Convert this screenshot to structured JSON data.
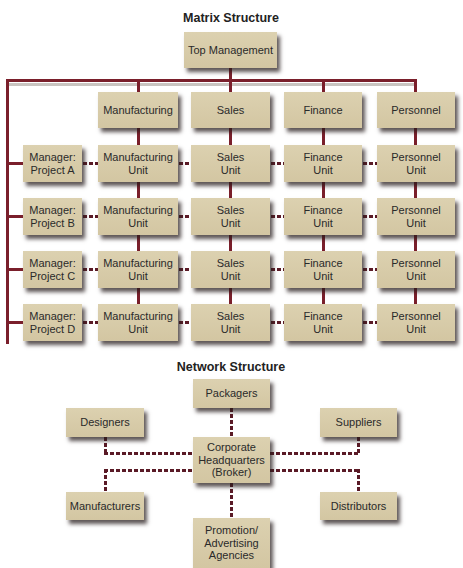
{
  "matrix": {
    "title": "Matrix Structure",
    "top": "Top Management",
    "departments": [
      "Manufacturing",
      "Sales",
      "Finance",
      "Personnel"
    ],
    "projects": [
      {
        "manager": "Manager:\nProject A",
        "units": [
          "Manufacturing\nUnit",
          "Sales\nUnit",
          "Finance\nUnit",
          "Personnel\nUnit"
        ]
      },
      {
        "manager": "Manager:\nProject B",
        "units": [
          "Manufacturing\nUnit",
          "Sales\nUnit",
          "Finance\nUnit",
          "Personnel\nUnit"
        ]
      },
      {
        "manager": "Manager:\nProject C",
        "units": [
          "Manufacturing\nUnit",
          "Sales\nUnit",
          "Finance\nUnit",
          "Personnel\nUnit"
        ]
      },
      {
        "manager": "Manager:\nProject D",
        "units": [
          "Manufacturing\nUnit",
          "Sales\nUnit",
          "Finance\nUnit",
          "Personnel\nUnit"
        ]
      }
    ]
  },
  "network": {
    "title": "Network Structure",
    "center": "Corporate\nHeadquarters\n(Broker)",
    "top": "Packagers",
    "left_top": "Designers",
    "right_top": "Suppliers",
    "left_bottom": "Manufacturers",
    "right_bottom": "Distributors",
    "bottom": "Promotion/\nAdvertising\nAgencies"
  },
  "colors": {
    "box_fill": "#d7cba8",
    "line": "#7a1f2b",
    "dash": "#5a1a26"
  }
}
